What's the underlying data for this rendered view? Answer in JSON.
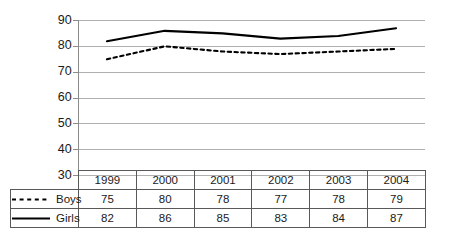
{
  "chart_data": {
    "type": "line",
    "title": "",
    "subtitle": "",
    "xlabel": "",
    "ylabel": "",
    "categories": [
      "1999",
      "2000",
      "2001",
      "2002",
      "2003",
      "2004"
    ],
    "series": [
      {
        "name": "Boys",
        "style": "dashed",
        "color": "#000000",
        "values": [
          75,
          80,
          78,
          77,
          78,
          79
        ]
      },
      {
        "name": "Girls",
        "style": "solid",
        "color": "#000000",
        "values": [
          82,
          86,
          85,
          83,
          84,
          87
        ]
      }
    ],
    "ylim": [
      30,
      90
    ],
    "yticks": [
      30,
      40,
      50,
      60,
      70,
      80,
      90
    ],
    "ytick_labels": [
      "30",
      "40",
      "50",
      "60",
      "70",
      "80",
      "90"
    ],
    "grid": true,
    "grid_color": "#b3b3b3",
    "axis_color": "#808080",
    "legend_position": "data-table-left",
    "has_data_table": true
  },
  "table": {
    "corner_label": "",
    "year_header": [
      "1999",
      "2000",
      "2001",
      "2002",
      "2003",
      "2004"
    ],
    "rows": [
      {
        "label": "Boys",
        "marker": "dashed-line-icon",
        "values": [
          "75",
          "80",
          "78",
          "77",
          "78",
          "79"
        ]
      },
      {
        "label": "Girls",
        "marker": "solid-line-icon",
        "values": [
          "82",
          "86",
          "85",
          "83",
          "84",
          "87"
        ]
      }
    ]
  },
  "axis": {
    "ytick_labels": [
      "90",
      "80",
      "70",
      "60",
      "50",
      "40",
      "30"
    ]
  }
}
